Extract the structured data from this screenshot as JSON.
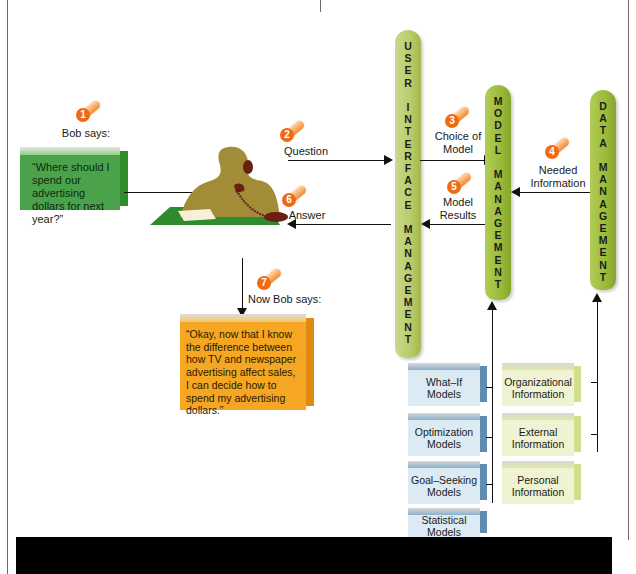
{
  "diagram": {
    "type": "decision-support-system-flow",
    "steps": [
      {
        "number": "1",
        "label": "Bob says:"
      },
      {
        "number": "2",
        "label": "Question"
      },
      {
        "number": "3",
        "label": "Choice of Model"
      },
      {
        "number": "4",
        "label": "Needed Information"
      },
      {
        "number": "5",
        "label": "Model Results"
      },
      {
        "number": "6",
        "label": "Answer"
      },
      {
        "number": "7",
        "label": "Now Bob says:"
      }
    ],
    "bob_question": "“Where should I spend our advertising dollars for next year?”",
    "bob_conclusion": "“Okay, now that I know the difference between how TV and newspaper advertising affect sales, I can decide how to spend my advertising dollars.”",
    "pillars": {
      "user_interface": "U\nS\nE\nR\n\nI\nN\nT\nE\nR\nF\nA\nC\nE\n\nM\nA\nN\nA\nG\nE\nM\nE\nN\nT",
      "model": "M\nO\nD\nE\nL\n\nM\nA\nN\nA\nG\nE\nM\nE\nN\nT",
      "data": "D\nA\nT\nA\n\nM\nA\nN\nA\nG\nE\nM\nE\nN\nT"
    },
    "models": [
      "What–If Models",
      "Optimization Models",
      "Goal–Seeking Models",
      "Statistical Models"
    ],
    "information": [
      "Organizational Information",
      "External Information",
      "Personal Information"
    ],
    "colors": {
      "question_box": "#4aa34a",
      "conclusion_box": "#f5a623",
      "pillar_green": "#b9cc6a",
      "badge_orange": "#ef6a12",
      "model_box": "#dceaf3",
      "info_box": "#eff3d2"
    }
  }
}
